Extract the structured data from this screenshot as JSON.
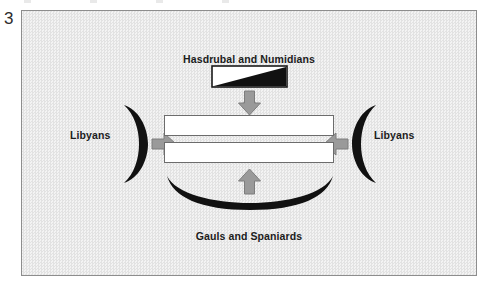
{
  "figure": {
    "number": "3",
    "type": "battle-formation-diagram"
  },
  "panel": {
    "background_color": "#ebebeb",
    "border_color": "#8d8d8d"
  },
  "labels": {
    "top": "Hasdrubal and Numidians",
    "bottom": "Gauls and Spaniards",
    "left": "Libyans",
    "right": "Libyans"
  },
  "colors": {
    "force_fill": "#111111",
    "arrow_fill": "#9a9a9a",
    "arrow_stroke": "#7a7a7a",
    "block_fill": "#ffffff",
    "block_stroke": "#6c6c6c",
    "text": "#1c1c1c"
  },
  "units": [
    {
      "name": "Hasdrubal and Numidians",
      "shape": "wedge",
      "position": "top",
      "fill": "#111111",
      "attack_direction": "down"
    },
    {
      "name": "Libyans",
      "shape": "crescent",
      "position": "left",
      "fill": "#111111",
      "attack_direction": "right"
    },
    {
      "name": "Libyans",
      "shape": "crescent",
      "position": "right",
      "fill": "#111111",
      "attack_direction": "left"
    },
    {
      "name": "Gauls and Spaniards",
      "shape": "crescent",
      "position": "bottom",
      "fill": "#111111",
      "attack_direction": "up"
    }
  ],
  "center_formation": {
    "name": "Roman infantry",
    "blocks": 2,
    "fill": "#ffffff",
    "stroke": "#6c6c6c"
  },
  "arrows": [
    {
      "name": "arrow-down",
      "direction": "down"
    },
    {
      "name": "arrow-right",
      "direction": "right"
    },
    {
      "name": "arrow-left",
      "direction": "left"
    },
    {
      "name": "arrow-up",
      "direction": "up"
    }
  ]
}
